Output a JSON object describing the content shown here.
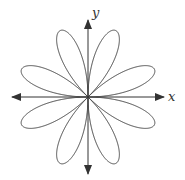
{
  "diagram": {
    "type": "polar rose curve",
    "petals": 8,
    "axes": {
      "x_label": "x",
      "y_label": "y"
    },
    "colors": {
      "stroke": "#444444",
      "background": "#ffffff"
    }
  }
}
